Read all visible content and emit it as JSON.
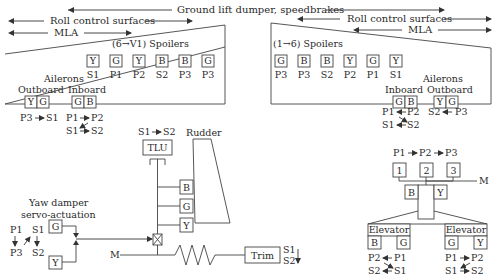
{
  "top_bars": {
    "ground_lift": "Ground lift dumper, speedbrakes",
    "roll_left": "Roll control surfaces",
    "roll_right": "Roll control surfaces",
    "mla_left": "MLA",
    "mla_right": "MLA"
  },
  "left_wing": {
    "spoilers_title": "(6→V1) Spoilers",
    "spoilers": [
      {
        "system": "Y",
        "label": "S1"
      },
      {
        "system": "G",
        "label": "P1"
      },
      {
        "system": "Y",
        "label": "P2"
      },
      {
        "system": "B",
        "label": "S2"
      },
      {
        "system": "B",
        "label": "P3"
      },
      {
        "system": "G",
        "label": "P3"
      }
    ],
    "ailerons_label": "Ailerons",
    "outboard_label": "Outboard",
    "inboard_label": "Inboard",
    "outboard_systems": [
      "Y",
      "G"
    ],
    "inboard_systems": [
      "G",
      "B"
    ],
    "outboard_computers": {
      "from": "P3",
      "to": "S1"
    },
    "inboard_computers": {
      "p_from": "P1",
      "p_to": "P2",
      "s_from": "S1",
      "s_to": "S2"
    }
  },
  "right_wing": {
    "spoilers_title": "(1→6) Spoilers",
    "spoilers": [
      {
        "system": "G",
        "label": "P3"
      },
      {
        "system": "B",
        "label": "P3"
      },
      {
        "system": "B",
        "label": "S2"
      },
      {
        "system": "Y",
        "label": "P2"
      },
      {
        "system": "G",
        "label": "P1"
      },
      {
        "system": "Y",
        "label": "S1"
      }
    ],
    "ailerons_label": "Ailerons",
    "inboard_label": "Inboard",
    "outboard_label": "Outboard",
    "inboard_systems": [
      "G",
      "B"
    ],
    "outboard_systems": [
      "Y",
      "G"
    ],
    "inboard_computers": {
      "p_a": "P1",
      "p_b": "P2",
      "s_a": "S1",
      "s_b": "S2"
    },
    "outboard_computers": {
      "a": "S2",
      "b": "P3"
    }
  },
  "rudder": {
    "tlu_computers": {
      "from": "S1",
      "to": "S2"
    },
    "tlu_label": "TLU",
    "rudder_label": "Rudder",
    "actuators": [
      "B",
      "G",
      "Y"
    ],
    "mechanical_label": "M",
    "trim_label": "Trim",
    "trim_computers": [
      "S1",
      "S2"
    ]
  },
  "yaw_damper": {
    "title_line1": "Yaw damper",
    "title_line2": "servo-actuation",
    "systems": [
      "G",
      "Y"
    ],
    "computers": {
      "p_top": "P1",
      "p_bottom": "P3",
      "s_top": "S1",
      "s_bottom": "S2"
    }
  },
  "pitch": {
    "computers": {
      "c1": "P1",
      "c2": "P2",
      "c3": "P3"
    },
    "thsa_motors": [
      "1",
      "2",
      "3"
    ],
    "mechanical_label": "M",
    "thsa_systems": [
      "B",
      "Y"
    ],
    "left_elevator": {
      "label": "Elevator",
      "systems": [
        "B",
        "G"
      ],
      "p_a": "P2",
      "p_b": "P1",
      "s_a": "S2",
      "s_b": "S1"
    },
    "right_elevator": {
      "label": "Elevator",
      "systems": [
        "G",
        "Y"
      ],
      "p_a": "P1",
      "p_b": "P2",
      "s_a": "S1",
      "s_b": "S2"
    }
  }
}
